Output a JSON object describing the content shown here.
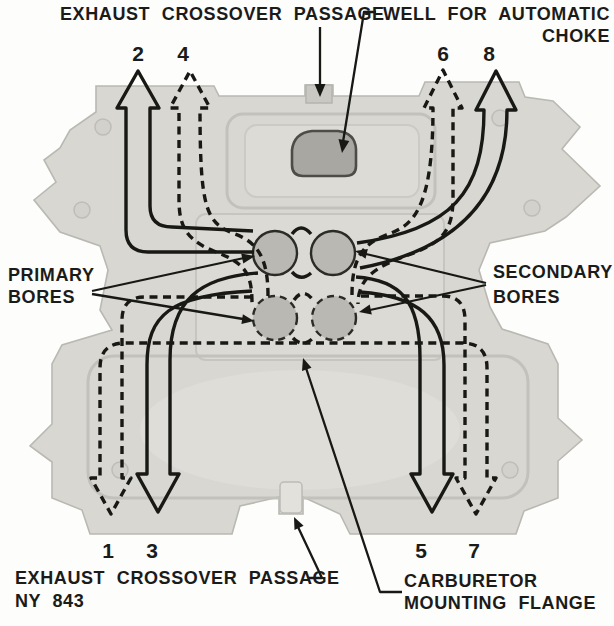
{
  "figure_type": "intake-manifold fuel/exhaust flow diagram",
  "colors": {
    "background": "#fdfdfc",
    "ink": "#181815",
    "casting_body": "#d8d7d2",
    "casting_edge": "#b9b8b2",
    "bore_fill": "#b9b8b2",
    "choke_well_fill": "#a8a7a2",
    "choke_well_edge": "#4c4c48"
  },
  "labels": {
    "exhaust_crossover_top": "EXHAUST CROSSOVER PASSAGE",
    "well_for_automatic_choke_line1": "WELL FOR AUTOMATIC",
    "well_for_automatic_choke_line2": "CHOKE",
    "primary_bores_line1": "PRIMARY",
    "primary_bores_line2": "BORES",
    "secondary_bores_line1": "SECONDARY",
    "secondary_bores_line2": "BORES",
    "exhaust_crossover_bottom": "EXHAUST CROSSOVER PASSAGE",
    "figure_code": "NY 843",
    "carburetor_flange_line1": "CARBURETOR",
    "carburetor_flange_line2": "MOUNTING FLANGE"
  },
  "runner_numbers": {
    "top": [
      {
        "n": "2",
        "line_style": "solid"
      },
      {
        "n": "4",
        "line_style": "dashed"
      },
      {
        "n": "6",
        "line_style": "dashed"
      },
      {
        "n": "8",
        "line_style": "solid"
      }
    ],
    "bottom": [
      {
        "n": "1",
        "line_style": "dashed"
      },
      {
        "n": "3",
        "line_style": "solid"
      },
      {
        "n": "5",
        "line_style": "solid"
      },
      {
        "n": "7",
        "line_style": "dashed"
      }
    ]
  }
}
